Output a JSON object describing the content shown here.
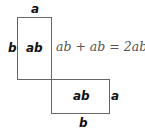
{
  "diagram": {
    "rect_top": {
      "label": "ab",
      "top_side": "a",
      "left_side": "b"
    },
    "rect_bottom": {
      "label": "ab",
      "right_side": "a",
      "bottom_side": "b"
    },
    "equation": "ab + ab = 2ab"
  }
}
